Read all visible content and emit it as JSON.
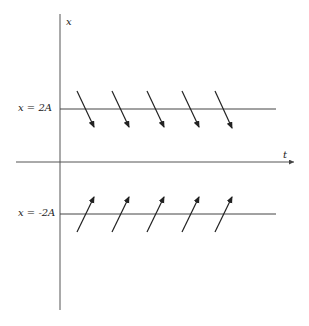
{
  "diagram": {
    "axes": {
      "vertical_label": "x",
      "horizontal_label": "t"
    },
    "levels": [
      {
        "label": "x = 2A",
        "y": 109,
        "arrow_direction": "down-right"
      },
      {
        "label": "x = -2A",
        "y": 214,
        "arrow_direction": "up-right"
      }
    ],
    "arrow_positions_x": [
      77,
      112,
      147,
      182,
      215
    ],
    "colors": {
      "line": "#444444",
      "arrow": "#222222",
      "background": "#ffffff"
    }
  }
}
